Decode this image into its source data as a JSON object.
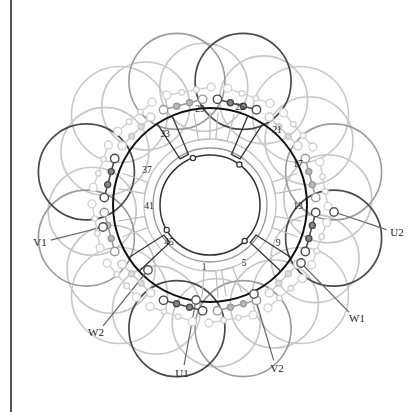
{
  "diagram": {
    "title": "",
    "type": "three-phase stator winding connection diagram",
    "colors": {
      "phase_dark": "#444444",
      "phase_mid": "#8a8a8a",
      "phase_light": "#c4c4c4",
      "stator_ring": "#111111",
      "border": "#555555"
    },
    "slot_labels": [
      {
        "text": "1",
        "x": 204,
        "y": 268
      },
      {
        "text": "5",
        "x": 244,
        "y": 264
      },
      {
        "text": "9",
        "x": 278,
        "y": 244
      },
      {
        "text": "13",
        "x": 298,
        "y": 207
      },
      {
        "text": "17",
        "x": 298,
        "y": 165
      },
      {
        "text": "21",
        "x": 277,
        "y": 131
      },
      {
        "text": "25",
        "x": 240,
        "y": 108
      },
      {
        "text": "29",
        "x": 200,
        "y": 110
      },
      {
        "text": "33",
        "x": 165,
        "y": 135
      },
      {
        "text": "37",
        "x": 147,
        "y": 171
      },
      {
        "text": "41",
        "x": 149,
        "y": 207
      },
      {
        "text": "45",
        "x": 169,
        "y": 243
      }
    ],
    "terminals": [
      {
        "text": "V1",
        "x": 40,
        "y": 242,
        "line_to": [
          103,
          227
        ]
      },
      {
        "text": "U2",
        "x": 397,
        "y": 232,
        "line_to": [
          334,
          212
        ]
      },
      {
        "text": "W2",
        "x": 96,
        "y": 332,
        "line_to": [
          148,
          270
        ]
      },
      {
        "text": "W1",
        "x": 357,
        "y": 318,
        "line_to": [
          301,
          263
        ]
      },
      {
        "text": "U1",
        "x": 182,
        "y": 373,
        "line_to": [
          196,
          300
        ]
      },
      {
        "text": "V2",
        "x": 277,
        "y": 368,
        "line_to": [
          254,
          294
        ]
      }
    ]
  }
}
